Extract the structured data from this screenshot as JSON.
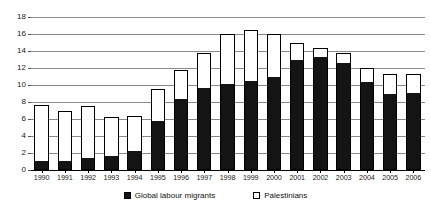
{
  "chart_data": {
    "type": "bar",
    "stacked": true,
    "title": "",
    "subtitle": "",
    "xlabel": "",
    "ylabel": "",
    "ylim": [
      0,
      18
    ],
    "ytick_step": 2,
    "yticks": [
      0,
      2,
      4,
      6,
      8,
      10,
      12,
      14,
      16,
      18
    ],
    "ytick_labels": [
      "0",
      "2",
      "4",
      "6",
      "8",
      "10",
      "12",
      "14",
      "16",
      "18"
    ],
    "grid": true,
    "grid_axis": "y",
    "legend_position": "bottom",
    "categories": [
      "1990",
      "1991",
      "1992",
      "1993",
      "1994",
      "1995",
      "1996",
      "1997",
      "1998",
      "1999",
      "2000",
      "2001",
      "2002",
      "2003",
      "2004",
      "2005",
      "2006"
    ],
    "series": [
      {
        "name": "Global labour migrants",
        "color": "#141414",
        "swatch": "filled",
        "values": [
          1.0,
          1.0,
          1.3,
          1.5,
          2.1,
          5.7,
          8.2,
          9.5,
          10.0,
          10.3,
          10.8,
          12.8,
          13.2,
          12.5,
          10.2,
          8.8,
          9.0
        ]
      },
      {
        "name": "Palestinians",
        "color": "#ffffff",
        "swatch": "hollow",
        "values": [
          6.7,
          6.0,
          6.2,
          4.7,
          4.2,
          3.8,
          3.6,
          4.3,
          6.0,
          6.2,
          5.2,
          2.2,
          1.1,
          1.3,
          1.8,
          2.5,
          2.3
        ]
      }
    ],
    "totals": [
      7.7,
      7.0,
      7.5,
      6.2,
      6.3,
      9.5,
      11.8,
      13.8,
      16.0,
      16.5,
      16.0,
      15.0,
      14.3,
      13.8,
      12.0,
      11.3,
      11.3
    ]
  },
  "legend": {
    "items": [
      {
        "label": "Global labour migrants",
        "swatch": "filled"
      },
      {
        "label": "Palestinians",
        "swatch": "hollow"
      }
    ]
  }
}
